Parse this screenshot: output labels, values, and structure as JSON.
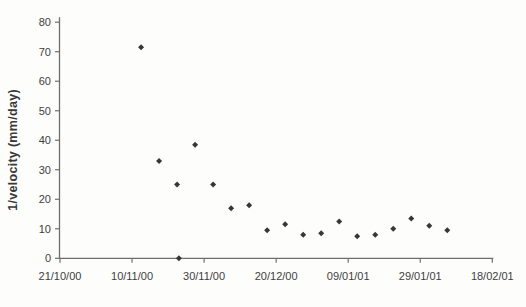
{
  "figure": {
    "kind": "scanned scatter chart",
    "background_color": "#fdfdfc"
  },
  "chart_data": {
    "type": "scatter",
    "title": "",
    "xlabel": "",
    "ylabel": "1/velocity (mm/day)",
    "xlim_days": [
      0,
      120
    ],
    "ylim": [
      0,
      80
    ],
    "x_axis_start_date": "21/10/00",
    "x_tick_days": [
      0,
      20,
      40,
      60,
      80,
      100,
      120
    ],
    "x_tick_labels": [
      "21/10/00",
      "10/11/00",
      "30/11/00",
      "20/12/00",
      "09/01/01",
      "29/01/01",
      "18/02/01"
    ],
    "y_tick_values": [
      0,
      10,
      20,
      30,
      40,
      50,
      60,
      70,
      80
    ],
    "grid": false,
    "legend_position": "none",
    "marker": {
      "shape": "diamond",
      "color": "#373737",
      "size_px": 6
    },
    "axis_color": "#6f6f6f",
    "label_color": "#3e3e3e",
    "series": [
      {
        "name": "1/velocity (mm/day)",
        "points": [
          {
            "day": 22.5,
            "date_approx": "12/11/00",
            "value": 71.5
          },
          {
            "day": 27.5,
            "date_approx": "17/11/00",
            "value": 33
          },
          {
            "day": 32.5,
            "date_approx": "22/11/00",
            "value": 25
          },
          {
            "day": 33,
            "date_approx": "23/11/00",
            "value": 0
          },
          {
            "day": 37.5,
            "date_approx": "27/11/00",
            "value": 38.5
          },
          {
            "day": 42.5,
            "date_approx": "02/12/00",
            "value": 25
          },
          {
            "day": 47.5,
            "date_approx": "07/12/00",
            "value": 17
          },
          {
            "day": 52.5,
            "date_approx": "12/12/00",
            "value": 18
          },
          {
            "day": 57.5,
            "date_approx": "17/12/00",
            "value": 9.5
          },
          {
            "day": 62.5,
            "date_approx": "22/12/00",
            "value": 11.5
          },
          {
            "day": 67.5,
            "date_approx": "27/12/00",
            "value": 8
          },
          {
            "day": 72.5,
            "date_approx": "01/01/01",
            "value": 8.5
          },
          {
            "day": 77.5,
            "date_approx": "06/01/01",
            "value": 12.5
          },
          {
            "day": 82.5,
            "date_approx": "11/01/01",
            "value": 7.5
          },
          {
            "day": 87.5,
            "date_approx": "16/01/01",
            "value": 8
          },
          {
            "day": 92.5,
            "date_approx": "21/01/01",
            "value": 10
          },
          {
            "day": 97.5,
            "date_approx": "26/01/01",
            "value": 13.5
          },
          {
            "day": 102.5,
            "date_approx": "31/01/01",
            "value": 11
          },
          {
            "day": 107.5,
            "date_approx": "05/02/01",
            "value": 9.5
          }
        ]
      }
    ]
  }
}
